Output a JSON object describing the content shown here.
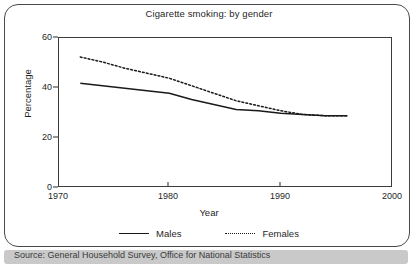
{
  "figure": {
    "title": "Cigarette smoking: by gender",
    "source_note": "Source: General Household Survey, Office for National Statistics"
  },
  "axes": {
    "y_title": "Percentage",
    "x_title": "Year",
    "y_ticks": [
      "0",
      "20",
      "40",
      "60"
    ],
    "x_ticks": [
      "1970",
      "1980",
      "1990",
      "2000"
    ]
  },
  "legend": {
    "males_label": "Males",
    "females_label": "Females",
    "males_style": "solid",
    "females_style": "dotted"
  },
  "colors": {
    "line": "#1a1a1a",
    "frame": "#3c3c3c",
    "panel_border": "#4a4a4a",
    "background": "#ffffff",
    "source_bar": "#c9c9c9"
  },
  "chart_data": {
    "type": "line",
    "title": "Cigarette smoking: by gender",
    "xlabel": "Year",
    "ylabel": "Percentage",
    "xlim": [
      1970,
      2000
    ],
    "ylim": [
      0,
      60
    ],
    "yticks": [
      0,
      20,
      40,
      60
    ],
    "xticks": [
      1970,
      1980,
      1990,
      2000
    ],
    "grid": false,
    "legend_position": "below",
    "x": [
      1972,
      1974,
      1976,
      1978,
      1980,
      1982,
      1984,
      1986,
      1988,
      1990,
      1992,
      1994,
      1996
    ],
    "series": [
      {
        "name": "Males",
        "style": "solid",
        "values": [
          41.5,
          40.5,
          39.5,
          38.5,
          37.5,
          35.0,
          33.0,
          31.0,
          30.5,
          29.5,
          29.0,
          28.5,
          28.5
        ]
      },
      {
        "name": "Females",
        "style": "dotted",
        "values": [
          52.0,
          50.0,
          47.5,
          45.5,
          43.5,
          40.5,
          37.5,
          34.5,
          32.5,
          30.5,
          29.0,
          28.5,
          28.5
        ]
      }
    ]
  }
}
